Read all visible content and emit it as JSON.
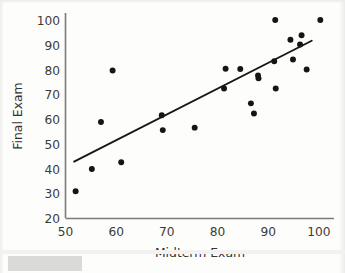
{
  "chart_data": {
    "type": "scatter",
    "title": "",
    "xlabel": "Midterm Exam",
    "ylabel": "Final Exam",
    "xlim": [
      50,
      103
    ],
    "ylim": [
      20,
      103
    ],
    "xticks": [
      50,
      60,
      70,
      80,
      90,
      100
    ],
    "yticks": [
      20,
      30,
      40,
      50,
      60,
      70,
      80,
      90,
      100
    ],
    "xtick_labels": [
      "50",
      "60",
      "70",
      "80",
      "90",
      "100"
    ],
    "ytick_labels": [
      "20",
      "30",
      "40",
      "50",
      "60",
      "70",
      "80",
      "90",
      "100"
    ],
    "grid": false,
    "legend": null,
    "marker": "filled-circle",
    "marker_color": "#151515",
    "marker_size": 4.6,
    "points": [
      {
        "x": 52.0,
        "y": 31.0
      },
      {
        "x": 55.2,
        "y": 40.0
      },
      {
        "x": 57.0,
        "y": 59.0
      },
      {
        "x": 59.3,
        "y": 79.8
      },
      {
        "x": 61.0,
        "y": 42.7
      },
      {
        "x": 69.0,
        "y": 61.7
      },
      {
        "x": 69.2,
        "y": 55.7
      },
      {
        "x": 75.5,
        "y": 56.7
      },
      {
        "x": 81.3,
        "y": 72.5
      },
      {
        "x": 81.6,
        "y": 80.5
      },
      {
        "x": 84.5,
        "y": 80.4
      },
      {
        "x": 86.6,
        "y": 66.5
      },
      {
        "x": 87.2,
        "y": 62.4
      },
      {
        "x": 88.0,
        "y": 77.8
      },
      {
        "x": 88.1,
        "y": 76.6
      },
      {
        "x": 91.2,
        "y": 83.5
      },
      {
        "x": 91.4,
        "y": 100.2
      },
      {
        "x": 91.5,
        "y": 72.5
      },
      {
        "x": 94.4,
        "y": 92.2
      },
      {
        "x": 94.9,
        "y": 84.2
      },
      {
        "x": 96.3,
        "y": 90.3
      },
      {
        "x": 96.6,
        "y": 94.0
      },
      {
        "x": 97.6,
        "y": 80.2
      },
      {
        "x": 100.3,
        "y": 100.2
      }
    ],
    "regression_line": {
      "name": "least-squares fit line",
      "color": "#171717",
      "x_start": 51.7,
      "y_start": 43.0,
      "x_end": 98.6,
      "y_end": 91.8
    },
    "axis_color": "#6f6f6f",
    "text_color": "#3a3a3a"
  }
}
